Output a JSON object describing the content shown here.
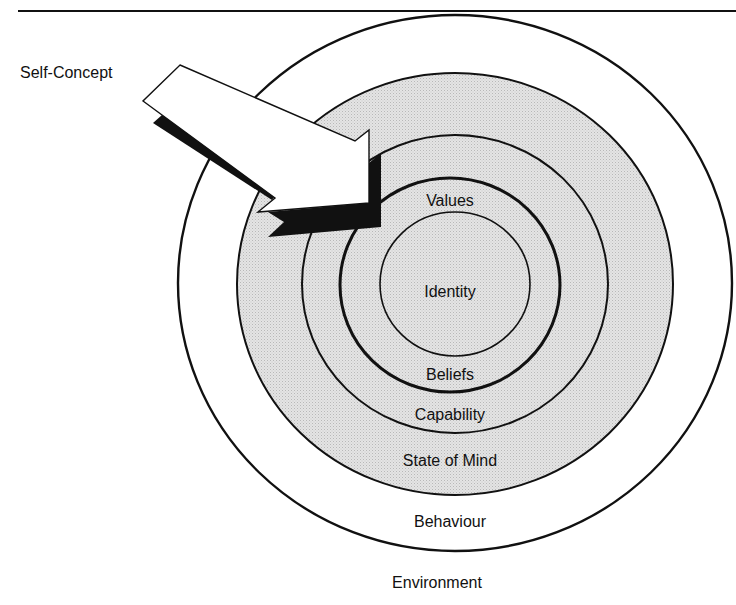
{
  "diagram": {
    "type": "concentric-levels",
    "arrow_label": "Self-Concept",
    "levels": [
      {
        "label": "Identity"
      },
      {
        "label": "Values"
      },
      {
        "label": "Beliefs"
      },
      {
        "label": "Capability"
      },
      {
        "label": "State of Mind"
      },
      {
        "label": "Behaviour"
      },
      {
        "label": "Environment"
      }
    ]
  },
  "colors": {
    "ink": "#111111",
    "shade": "#d9d9d9",
    "paper": "#ffffff"
  }
}
